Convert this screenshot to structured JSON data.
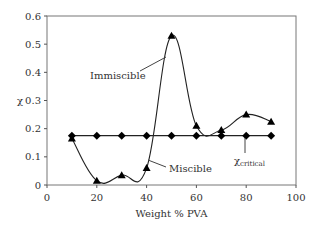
{
  "chart_data": {
    "type": "line",
    "title": "",
    "xlabel": "Weight % PVA",
    "ylabel": "χ",
    "xlim": [
      0,
      100
    ],
    "ylim": [
      0,
      0.6
    ],
    "x_ticks": [
      "0",
      "20",
      "40",
      "60",
      "80",
      "100"
    ],
    "y_ticks": [
      "0",
      "0.1",
      "0.2",
      "0.3",
      "0.4",
      "0.5",
      "0.6"
    ],
    "grid": false,
    "legend": null,
    "x": [
      10,
      20,
      30,
      40,
      50,
      60,
      70,
      80,
      90
    ],
    "series": [
      {
        "name": "χ",
        "marker": "triangle",
        "values": [
          0.165,
          0.015,
          0.035,
          0.06,
          0.53,
          0.21,
          0.195,
          0.25,
          0.225
        ]
      },
      {
        "name": "χcritical",
        "marker": "diamond",
        "values": [
          0.175,
          0.175,
          0.175,
          0.175,
          0.175,
          0.175,
          0.175,
          0.175,
          0.175
        ]
      }
    ],
    "annotations": [
      {
        "text": "Immiscible"
      },
      {
        "text": "Miscible"
      },
      {
        "text": "χ",
        "subscript": "critical"
      }
    ]
  }
}
